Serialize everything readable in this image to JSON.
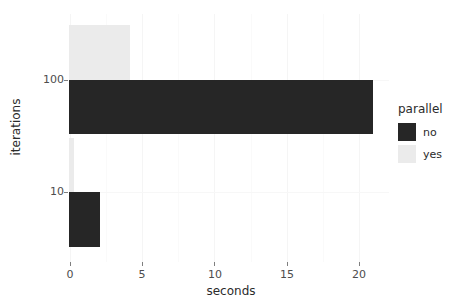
{
  "chart_data": {
    "type": "bar",
    "orientation": "horizontal",
    "title": "",
    "xlabel": "seconds",
    "ylabel": "iterations",
    "categories": [
      "100",
      "10"
    ],
    "xticks": [
      0,
      5,
      10,
      15,
      20
    ],
    "xlim": [
      0,
      22
    ],
    "grid": true,
    "legend_title": "parallel",
    "legend_position": "right",
    "series": [
      {
        "name": "yes",
        "color": "#ebebeb",
        "values": [
          4.2,
          0.35
        ]
      },
      {
        "name": "no",
        "color": "#262626",
        "values": [
          20.9,
          2.1
        ]
      }
    ]
  },
  "axes": {
    "x": {
      "label": "seconds",
      "tick_labels": [
        "0",
        "5",
        "10",
        "15",
        "20"
      ]
    },
    "y": {
      "label": "iterations",
      "tick_labels": [
        "100",
        "10"
      ]
    }
  },
  "legend": {
    "title": "parallel",
    "entries": [
      {
        "label": "no",
        "color": "#262626"
      },
      {
        "label": "yes",
        "color": "#ebebeb"
      }
    ]
  },
  "colors": {
    "background": "#ffffff",
    "gridline": "#f5f5f5",
    "tick_text": "#4d4d4d",
    "axis_title": "#2b2b2b",
    "bar_no": "#262626",
    "bar_yes": "#ebebeb"
  }
}
